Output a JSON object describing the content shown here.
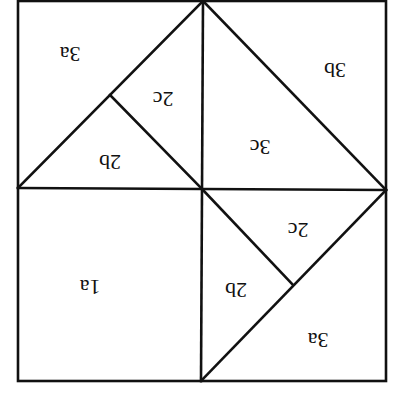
{
  "diagram": {
    "orientation": "rotated 180 degrees",
    "stroke_color": "#111111",
    "background": "#ffffff",
    "outer_square": {
      "x1": 18,
      "y1": 1,
      "x2": 386,
      "y2": 381
    },
    "center": {
      "x": 202,
      "y": 190
    },
    "pieces": [
      {
        "id": "3a_top",
        "label": "3a",
        "x": 70,
        "y": 52
      },
      {
        "id": "2c_top",
        "label": "2c",
        "x": 163,
        "y": 97
      },
      {
        "id": "2b_top",
        "label": "2b",
        "x": 110,
        "y": 160
      },
      {
        "id": "3b",
        "label": "3b",
        "x": 335,
        "y": 68
      },
      {
        "id": "3c",
        "label": "3c",
        "x": 260,
        "y": 145
      },
      {
        "id": "1a",
        "label": "1a",
        "x": 90,
        "y": 285
      },
      {
        "id": "2c_bottom",
        "label": "2c",
        "x": 298,
        "y": 228
      },
      {
        "id": "2b_bottom",
        "label": "2b",
        "x": 236,
        "y": 288
      },
      {
        "id": "3a_bottom",
        "label": "3a",
        "x": 318,
        "y": 338
      }
    ]
  }
}
